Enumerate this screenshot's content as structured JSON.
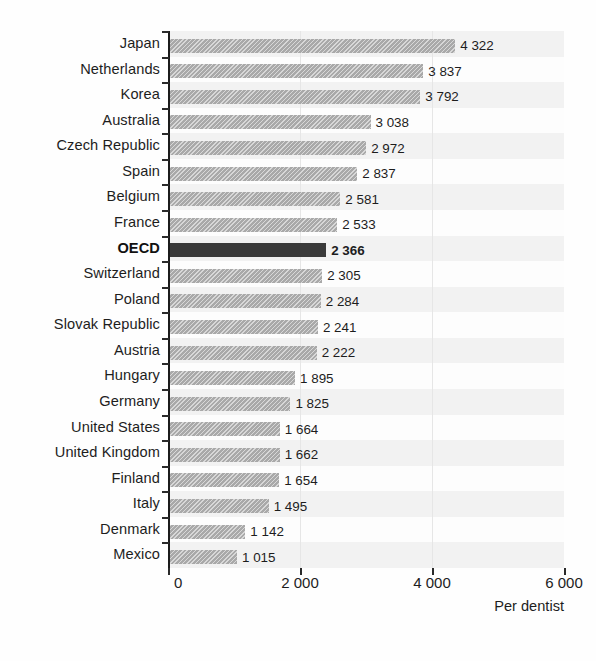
{
  "chart_data": {
    "type": "bar",
    "orientation": "horizontal",
    "title": "",
    "subtitle": "",
    "xlabel": "Per dentist",
    "ylabel": "",
    "xlim": [
      0,
      6000
    ],
    "xticks": [
      0,
      2000,
      4000,
      6000
    ],
    "xtick_labels": [
      "0",
      "2 000",
      "4 000",
      "6 000"
    ],
    "grid": false,
    "legend": "none",
    "highlight_category": "OECD",
    "categories": [
      "Japan",
      "Netherlands",
      "Korea",
      "Australia",
      "Czech Republic",
      "Spain",
      "Belgium",
      "France",
      "OECD",
      "Switzerland",
      "Poland",
      "Slovak Republic",
      "Austria",
      "Hungary",
      "Germany",
      "United States",
      "United Kingdom",
      "Finland",
      "Italy",
      "Denmark",
      "Mexico"
    ],
    "values": [
      4322,
      3837,
      3792,
      3038,
      2972,
      2837,
      2581,
      2533,
      2366,
      2305,
      2284,
      2241,
      2222,
      1895,
      1825,
      1664,
      1662,
      1654,
      1495,
      1142,
      1015
    ],
    "value_labels": [
      "4 322",
      "3 837",
      "3 792",
      "3 038",
      "2 972",
      "2 837",
      "2 581",
      "2 533",
      "2 366",
      "2 305",
      "2 284",
      "2 241",
      "2 222",
      "1 895",
      "1 825",
      "1 664",
      "1 662",
      "1 654",
      "1 495",
      "1 142",
      "1 015"
    ]
  },
  "colors": {
    "bar": "#a9a9a9",
    "bar_highlight": "#3a3a3a",
    "axis": "#1b1b1b",
    "text": "#1d1d1d",
    "background": "#fefefe",
    "band": "#f2f2f2"
  }
}
